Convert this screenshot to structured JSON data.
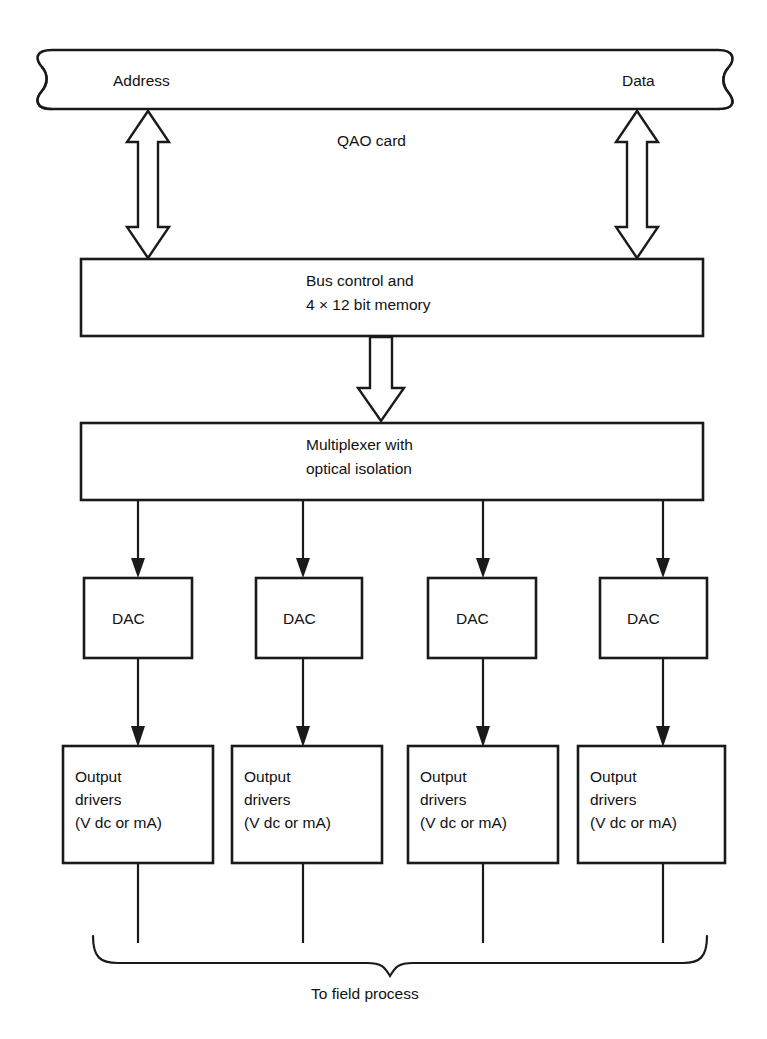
{
  "diagram": {
    "bus": {
      "left_label": "Address",
      "right_label": "Data"
    },
    "card_label": "QAO card",
    "blocks": {
      "bus_control": {
        "line1": "Bus control and",
        "line2": "4 × 12 bit memory"
      },
      "multiplexer": {
        "line1": "Multiplexer with",
        "line2": "optical isolation"
      }
    },
    "dac_label": "DAC",
    "dacs": [
      {
        "label": "DAC"
      },
      {
        "label": "DAC"
      },
      {
        "label": "DAC"
      },
      {
        "label": "DAC"
      }
    ],
    "output_drivers": [
      {
        "line1": "Output",
        "line2": "drivers",
        "line3": "(V dc or mA)"
      },
      {
        "line1": "Output",
        "line2": "drivers",
        "line3": "(V dc or mA)"
      },
      {
        "line1": "Output",
        "line2": "drivers",
        "line3": "(V dc or mA)"
      },
      {
        "line1": "Output",
        "line2": "drivers",
        "line3": "(V dc or mA)"
      }
    ],
    "footer_label": "To field process",
    "colors": {
      "ink": "#1a1a1a",
      "paper": "#ffffff"
    }
  }
}
